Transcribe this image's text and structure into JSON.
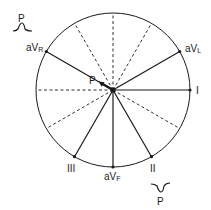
{
  "diagram": {
    "center": {
      "x": 113,
      "y": 90
    },
    "radius": 77,
    "colors": {
      "line": "#1a1a1a",
      "background": "#ffffff"
    },
    "leads": [
      {
        "name": "I",
        "angle": 0
      },
      {
        "name": "aVL",
        "angle": -30
      },
      {
        "name": "aVR",
        "angle": -150
      },
      {
        "name": "II",
        "angle": 60
      },
      {
        "name": "aVF",
        "angle": 90
      },
      {
        "name": "III",
        "angle": 120
      }
    ],
    "dashed_axes_angles": [
      -90,
      -120,
      -60,
      180,
      150,
      30
    ],
    "vector": {
      "label": "P",
      "angle": -150,
      "length": 17
    },
    "labels": {
      "lead_I": "I",
      "lead_II": "II",
      "lead_III": "III",
      "lead_aVR_prefix": "aV",
      "lead_aVR_sub": "R",
      "lead_aVL_prefix": "aV",
      "lead_aVL_sub": "L",
      "lead_aVF_prefix": "aV",
      "lead_aVF_sub": "F",
      "vector_label": "P",
      "upright_wave_label": "P",
      "inverted_wave_label": "P"
    },
    "waves": [
      {
        "label": "P",
        "polarity": "upright",
        "near_lead": "aVR"
      },
      {
        "label": "P",
        "polarity": "inverted",
        "near_lead": "II"
      }
    ]
  }
}
